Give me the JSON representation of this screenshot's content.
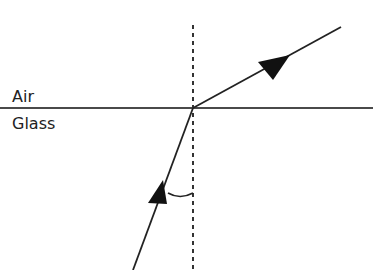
{
  "diagram": {
    "title": "",
    "media": {
      "top": "Air",
      "bottom": "Glass"
    },
    "elements": {
      "boundary": "interface line between air and glass",
      "normal": "dashed normal line",
      "incident_ray": "ray in glass traveling toward boundary",
      "refracted_ray": "ray in air traveling away from boundary",
      "angle_marker": "angle of incidence arc"
    },
    "colors": {
      "line": "#3a3a3a",
      "ray": "#222222",
      "text": "#222222"
    }
  }
}
